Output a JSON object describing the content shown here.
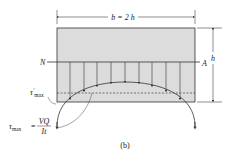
{
  "figure": {
    "caption": "(b)",
    "width_label": "b = 2 h",
    "height_label": "h",
    "neutral_axis": {
      "left": "N",
      "right": "A"
    },
    "tau_prime_label": {
      "symbol": "τ",
      "prime": "′",
      "sub": "max"
    },
    "tau_max_label": {
      "symbol": "τ",
      "sub": "max",
      "equals": "=",
      "numerator": "VQ",
      "denominator": "It"
    },
    "colors": {
      "section_fill": "#dcdcdc",
      "line": "#333333",
      "dashed": "#444444"
    }
  }
}
